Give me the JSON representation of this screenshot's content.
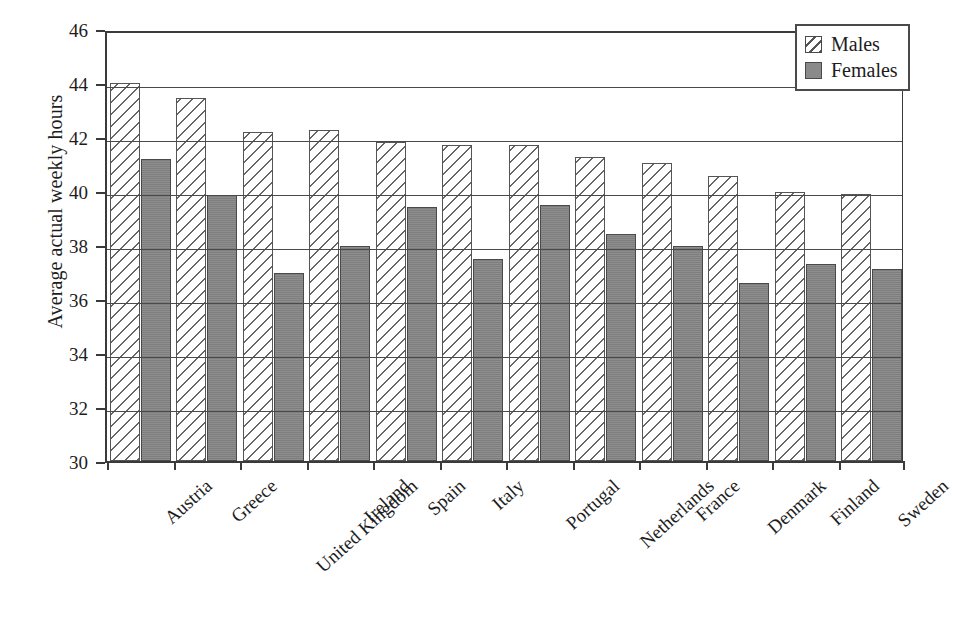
{
  "chart_data": {
    "type": "bar",
    "title": "",
    "subtitle": "",
    "xlabel": "",
    "ylabel": "Average actual weekly hours",
    "ylim": [
      30,
      46
    ],
    "ytick_step": 2,
    "yticks": [
      "46",
      "44",
      "42",
      "40",
      "38",
      "36",
      "34",
      "32",
      "30"
    ],
    "grid": true,
    "grid_axis": "y",
    "legend_position": "top-right",
    "categories": [
      "Austria",
      "Greece",
      "United Kingdom",
      "Ireland",
      "Spain",
      "Italy",
      "Portugal",
      "Netherlands",
      "France",
      "Denmark",
      "Finland",
      "Sweden"
    ],
    "series": [
      {
        "name": "Males",
        "pattern": "diagonal-hatch",
        "color": "#ffffff",
        "values": [
          44.0,
          43.45,
          42.2,
          42.25,
          41.8,
          41.7,
          41.7,
          41.25,
          41.05,
          40.55,
          39.95,
          39.9
        ]
      },
      {
        "name": "Females",
        "pattern": "solid-gray",
        "color": "#858585",
        "values": [
          41.2,
          39.85,
          36.95,
          37.95,
          39.4,
          37.5,
          39.5,
          38.4,
          37.95,
          36.6,
          37.3,
          37.1
        ]
      }
    ]
  },
  "legend": {
    "items": [
      {
        "label": "Males",
        "swatch": "males"
      },
      {
        "label": "Females",
        "swatch": "females"
      }
    ]
  },
  "colors": {
    "axis": "#3a3a3a",
    "grid": "#4a4a4a",
    "text": "#1d1d1d",
    "males_fill": "#ffffff",
    "males_hatch": "#666666",
    "females_fill": "#858585",
    "background": "#ffffff"
  }
}
